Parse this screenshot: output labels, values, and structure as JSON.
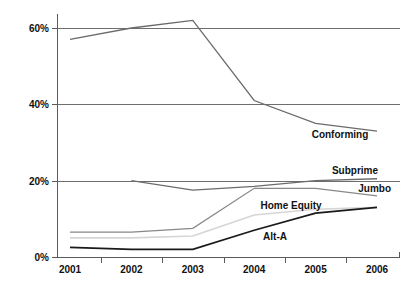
{
  "chart_data": {
    "type": "line",
    "title": "",
    "xlabel": "",
    "ylabel": "",
    "categories": [
      "2001",
      "2002",
      "2003",
      "2004",
      "2005",
      "2006"
    ],
    "x": [
      2001,
      2002,
      2003,
      2004,
      2005,
      2006
    ],
    "ylim": [
      0,
      65
    ],
    "yticks": [
      0,
      20,
      40,
      60
    ],
    "ytick_labels": [
      "0%",
      "20%",
      "40%",
      "60%"
    ],
    "grid": "horizontal",
    "legend_position": "inline-labels",
    "series": [
      {
        "name": "Conforming",
        "color": "#6b6b6b",
        "width": 1.3,
        "values": [
          57,
          60,
          62,
          41,
          35,
          33
        ],
        "label": "Conforming",
        "label_x": 340,
        "label_y": 138
      },
      {
        "name": "Subprime",
        "color": "#6b6b6b",
        "width": 1.3,
        "values": [
          null,
          20,
          17.5,
          18.5,
          20,
          20.5
        ],
        "label": "Subprime",
        "label_x": 355,
        "label_y": 174
      },
      {
        "name": "Jumbo",
        "color": "#888888",
        "width": 1.2,
        "values": [
          6.5,
          6.5,
          7.5,
          18,
          18,
          16
        ],
        "label": "Jumbo",
        "label_x": 391,
        "label_y": 192
      },
      {
        "name": "Home Equity",
        "color": "#d5d5d5",
        "width": 1.6,
        "values": [
          5,
          5,
          5.5,
          11,
          12.5,
          13
        ],
        "label": "Home Equity",
        "label_x": 291,
        "label_y": 209
      },
      {
        "name": "Alt-A",
        "color": "#1a1a1a",
        "width": 1.7,
        "values": [
          2.5,
          2,
          2,
          7,
          11.5,
          13
        ],
        "label": "Alt-A",
        "label_x": 275,
        "label_y": 240
      }
    ]
  },
  "axis": {
    "y_labels": [
      "60%",
      "40%",
      "20%",
      "0%"
    ],
    "x_labels": [
      "2001",
      "2002",
      "2003",
      "2004",
      "2005",
      "2006"
    ]
  }
}
